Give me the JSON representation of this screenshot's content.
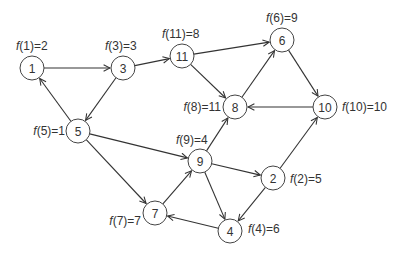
{
  "diagram": {
    "type": "directed-graph",
    "node_radius": 12,
    "colors": {
      "stroke": "#444444",
      "text": "#333333",
      "background": "#ffffff"
    },
    "nodes": [
      {
        "id": "1",
        "x": 32,
        "y": 68,
        "label": "1",
        "f_label": "f(1)=2",
        "f_value": 2,
        "f_x": 16,
        "f_y": 46,
        "f_anchor": "start"
      },
      {
        "id": "3",
        "x": 123,
        "y": 68,
        "label": "3",
        "f_label": "f(3)=3",
        "f_value": 3,
        "f_x": 105,
        "f_y": 46,
        "f_anchor": "start"
      },
      {
        "id": "11",
        "x": 182,
        "y": 56,
        "label": "11",
        "f_label": "f(11)=8",
        "f_value": 8,
        "f_x": 162,
        "f_y": 34,
        "f_anchor": "start"
      },
      {
        "id": "6",
        "x": 282,
        "y": 40,
        "label": "6",
        "f_label": "f(6)=9",
        "f_value": 9,
        "f_x": 266,
        "f_y": 18,
        "f_anchor": "start"
      },
      {
        "id": "8",
        "x": 235,
        "y": 107,
        "label": "8",
        "f_label": "f(8)=11",
        "f_value": 11,
        "f_x": 221,
        "f_y": 107,
        "f_anchor": "end"
      },
      {
        "id": "10",
        "x": 325,
        "y": 107,
        "label": "10",
        "f_label": "f(10)=10",
        "f_value": 10,
        "f_x": 342,
        "f_y": 107,
        "f_anchor": "start"
      },
      {
        "id": "5",
        "x": 78,
        "y": 131,
        "label": "5",
        "f_label": "f(5)=1",
        "f_value": 1,
        "f_x": 65,
        "f_y": 131,
        "f_anchor": "end"
      },
      {
        "id": "9",
        "x": 200,
        "y": 161,
        "label": "9",
        "f_label": "f(9)=4",
        "f_value": 4,
        "f_x": 176,
        "f_y": 140,
        "f_anchor": "start"
      },
      {
        "id": "2",
        "x": 273,
        "y": 178,
        "label": "2",
        "f_label": "f(2)=5",
        "f_value": 5,
        "f_x": 290,
        "f_y": 179,
        "f_anchor": "start"
      },
      {
        "id": "7",
        "x": 155,
        "y": 213,
        "label": "7",
        "f_label": "f(7)=7",
        "f_value": 7,
        "f_x": 141,
        "f_y": 221,
        "f_anchor": "end"
      },
      {
        "id": "4",
        "x": 230,
        "y": 231,
        "label": "4",
        "f_label": "f(4)=6",
        "f_value": 6,
        "f_x": 248,
        "f_y": 229,
        "f_anchor": "start"
      }
    ],
    "edges": [
      {
        "from": "1",
        "to": "3"
      },
      {
        "from": "3",
        "to": "11"
      },
      {
        "from": "3",
        "to": "5"
      },
      {
        "from": "5",
        "to": "1"
      },
      {
        "from": "11",
        "to": "6"
      },
      {
        "from": "11",
        "to": "8"
      },
      {
        "from": "8",
        "to": "6"
      },
      {
        "from": "6",
        "to": "10"
      },
      {
        "from": "10",
        "to": "8"
      },
      {
        "from": "5",
        "to": "9"
      },
      {
        "from": "5",
        "to": "7"
      },
      {
        "from": "9",
        "to": "8"
      },
      {
        "from": "9",
        "to": "2"
      },
      {
        "from": "9",
        "to": "4"
      },
      {
        "from": "7",
        "to": "9"
      },
      {
        "from": "2",
        "to": "10"
      },
      {
        "from": "2",
        "to": "4"
      },
      {
        "from": "4",
        "to": "7"
      }
    ]
  }
}
